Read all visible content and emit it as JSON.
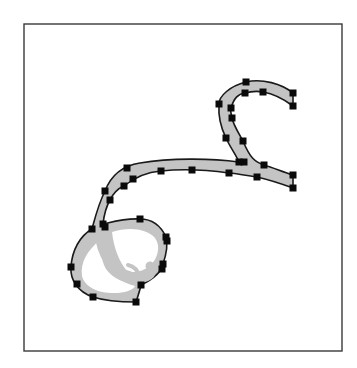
{
  "diagram": {
    "colors": {
      "frame": "#3a3a3a",
      "fill": "#c4c4c4",
      "outline": "#1a1a1a",
      "control_point": "#0a0a0a",
      "background": "#ffffff"
    },
    "frame": {
      "x": 24,
      "y": 24,
      "width": 318,
      "height": 327
    },
    "control_point_size": 7,
    "control_points": [
      [
        246,
        82
      ],
      [
        219,
        104
      ],
      [
        226,
        138
      ],
      [
        239,
        162
      ],
      [
        245,
        93
      ],
      [
        263,
        92
      ],
      [
        231,
        108
      ],
      [
        232,
        118
      ],
      [
        243,
        141
      ],
      [
        293,
        93
      ],
      [
        293,
        106
      ],
      [
        293,
        175
      ],
      [
        293,
        188
      ],
      [
        127,
        168
      ],
      [
        238,
        162
      ],
      [
        264,
        165
      ],
      [
        161,
        171
      ],
      [
        192,
        170
      ],
      [
        229,
        173
      ],
      [
        257,
        177
      ],
      [
        105,
        191
      ],
      [
        133,
        179
      ],
      [
        124,
        186
      ],
      [
        110,
        200
      ],
      [
        92,
        229
      ],
      [
        103,
        224
      ],
      [
        105,
        227
      ],
      [
        140,
        219
      ],
      [
        166,
        237
      ],
      [
        167,
        241
      ],
      [
        163,
        264
      ],
      [
        162,
        269
      ],
      [
        141,
        285
      ],
      [
        136,
        302
      ],
      [
        93,
        297
      ],
      [
        77,
        284
      ],
      [
        71,
        267
      ]
    ]
  }
}
